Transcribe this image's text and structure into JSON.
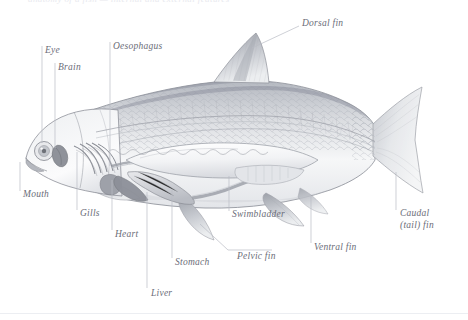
{
  "figure": {
    "top_cropped_text": "anatomy of a fish  —  internal and external features",
    "background_color": "#ffffff",
    "label_color": "#6b6d78",
    "leader_color": "#b9bcc4",
    "outline_color": "#8e9199",
    "body_fill": "#f3f4f6",
    "fin_fill": "#c9ccd2",
    "organ_fill": "#d6d8dd"
  },
  "labels": [
    {
      "id": "dorsal-fin",
      "text": "Dorsal fin",
      "x": 302,
      "y": 24,
      "lines": [
        "Dorsal fin"
      ]
    },
    {
      "id": "eye",
      "text": "Eye",
      "x": 45,
      "y": 48,
      "lines": [
        "Eye"
      ]
    },
    {
      "id": "oesophagus",
      "text": "Oesophagus",
      "x": 112,
      "y": 44,
      "lines": [
        "Oesophagus"
      ]
    },
    {
      "id": "brain",
      "text": "Brain",
      "x": 58,
      "y": 65,
      "lines": [
        "Brain"
      ]
    },
    {
      "id": "mouth",
      "text": "Mouth",
      "x": 22,
      "y": 193,
      "lines": [
        "Mouth"
      ]
    },
    {
      "id": "gills",
      "text": "Gills",
      "x": 79,
      "y": 212,
      "lines": [
        "Gills"
      ]
    },
    {
      "id": "swimbladder",
      "text": "Swimbladder",
      "x": 231,
      "y": 213,
      "lines": [
        "Swimbladder"
      ]
    },
    {
      "id": "caudal-fin",
      "text": "Caudal (tail) fin",
      "x": 399,
      "y": 212,
      "lines": [
        "Caudal",
        "(tail) fin"
      ]
    },
    {
      "id": "heart",
      "text": "Heart",
      "x": 114,
      "y": 232,
      "lines": [
        "Heart"
      ]
    },
    {
      "id": "ventral-fin",
      "text": "Ventral fin",
      "x": 313,
      "y": 245,
      "lines": [
        "Ventral fin"
      ]
    },
    {
      "id": "pelvic-fin",
      "text": "Pelvic fin",
      "x": 236,
      "y": 253,
      "lines": [
        "Pelvic fin"
      ]
    },
    {
      "id": "stomach",
      "text": "Stomach",
      "x": 174,
      "y": 260,
      "lines": [
        "Stomach"
      ]
    },
    {
      "id": "liver",
      "text": "Liver",
      "x": 150,
      "y": 290,
      "lines": [
        "Liver"
      ]
    }
  ],
  "anatomy_parts": [
    "body-outline",
    "head",
    "eye",
    "brain",
    "mouth",
    "gill-arches",
    "heart",
    "oesophagus",
    "swimbladder",
    "stomach",
    "liver",
    "intestine",
    "dorsal-fin",
    "pectoral-fin",
    "pelvic-fin",
    "ventral-fin",
    "caudal-fin",
    "lateral-line",
    "scales",
    "vertebral-column"
  ]
}
